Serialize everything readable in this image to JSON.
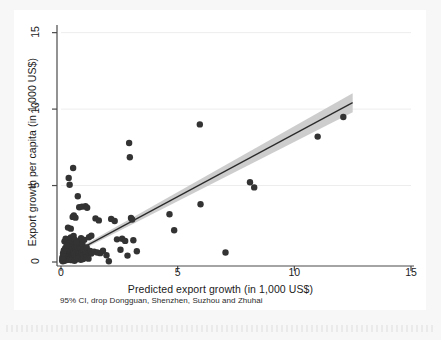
{
  "figure": {
    "background": "#f7f7f7",
    "panel_background": "#ffffff",
    "note": "95% CI, drop Dongguan, Shenzhen, Suzhou and Zhuhai"
  },
  "chart_data": {
    "type": "scatter",
    "title": "",
    "xlabel": "Predicted export growth (in 1,000 US$)",
    "ylabel": "Export growth per capita (in 1,000 US$)",
    "xlim": [
      0,
      15
    ],
    "ylim": [
      0,
      15.5
    ],
    "xticks": [
      0,
      5,
      10,
      15
    ],
    "yticks": [
      0,
      5,
      10,
      15
    ],
    "xtick_labels": [
      "0",
      "5",
      "10",
      "15"
    ],
    "ytick_labels": [
      "0",
      "5",
      "10",
      "15"
    ],
    "grid": "horizontal-faint",
    "legend": "none",
    "marker_color": "#333333",
    "marker_size": 3.2,
    "line_color": "#2a2a2a",
    "band_color": "#c4c4c4",
    "band_opacity": 0.85,
    "fit": {
      "label": "linear fit with 95% CI",
      "x_start": 0.3,
      "y_start": 0.42,
      "x_end": 12.5,
      "y_end": 10.42,
      "slope": 0.82,
      "intercept": 0.17,
      "ci_halfwidth_start": 0.1,
      "ci_halfwidth_end": 0.62
    },
    "points": [
      [
        0.05,
        0.1
      ],
      [
        0.07,
        0.22
      ],
      [
        0.08,
        0.05
      ],
      [
        0.09,
        0.35
      ],
      [
        0.1,
        0.15
      ],
      [
        0.11,
        0.48
      ],
      [
        0.12,
        0.28
      ],
      [
        0.13,
        0.62
      ],
      [
        0.14,
        0.08
      ],
      [
        0.15,
        0.4
      ],
      [
        0.16,
        0.2
      ],
      [
        0.17,
        0.7
      ],
      [
        0.18,
        0.33
      ],
      [
        0.19,
        0.55
      ],
      [
        0.2,
        0.12
      ],
      [
        0.21,
        0.85
      ],
      [
        0.22,
        0.45
      ],
      [
        0.23,
        0.25
      ],
      [
        0.24,
        0.6
      ],
      [
        0.25,
        0.18
      ],
      [
        0.26,
        0.95
      ],
      [
        0.27,
        0.38
      ],
      [
        0.28,
        0.72
      ],
      [
        0.29,
        0.3
      ],
      [
        0.3,
        0.52
      ],
      [
        0.31,
        0.15
      ],
      [
        0.32,
        0.8
      ],
      [
        0.33,
        0.42
      ],
      [
        0.34,
        1.05
      ],
      [
        0.35,
        0.26
      ],
      [
        0.36,
        0.66
      ],
      [
        0.37,
        0.36
      ],
      [
        0.38,
        0.9
      ],
      [
        0.39,
        0.2
      ],
      [
        0.4,
        0.58
      ],
      [
        0.41,
        0.44
      ],
      [
        0.42,
        1.15
      ],
      [
        0.43,
        0.32
      ],
      [
        0.44,
        0.76
      ],
      [
        0.45,
        0.24
      ],
      [
        0.46,
        0.5
      ],
      [
        0.47,
        1.0
      ],
      [
        0.48,
        0.68
      ],
      [
        0.49,
        0.4
      ],
      [
        0.5,
        0.86
      ],
      [
        0.51,
        0.3
      ],
      [
        0.52,
        0.6
      ],
      [
        0.53,
        1.25
      ],
      [
        0.54,
        0.46
      ],
      [
        0.55,
        0.74
      ],
      [
        0.56,
        0.22
      ],
      [
        0.57,
        0.96
      ],
      [
        0.58,
        0.54
      ],
      [
        0.59,
        1.4
      ],
      [
        0.6,
        0.35
      ],
      [
        0.62,
        0.82
      ],
      [
        0.64,
        0.64
      ],
      [
        0.66,
        1.1
      ],
      [
        0.68,
        0.48
      ],
      [
        0.7,
        0.92
      ],
      [
        0.72,
        0.28
      ],
      [
        0.74,
        1.3
      ],
      [
        0.76,
        0.7
      ],
      [
        0.78,
        0.56
      ],
      [
        0.8,
        1.02
      ],
      [
        0.82,
        0.4
      ],
      [
        0.84,
        0.88
      ],
      [
        0.86,
        1.55
      ],
      [
        0.88,
        0.62
      ],
      [
        0.9,
        0.34
      ],
      [
        0.92,
        1.18
      ],
      [
        0.95,
        0.78
      ],
      [
        0.98,
        0.5
      ],
      [
        1.0,
        1.45
      ],
      [
        1.05,
        0.68
      ],
      [
        1.1,
        0.95
      ],
      [
        1.15,
        0.42
      ],
      [
        1.2,
        1.62
      ],
      [
        1.25,
        0.72
      ],
      [
        1.3,
        0.56
      ],
      [
        0.15,
        1.35
      ],
      [
        0.2,
        1.52
      ],
      [
        0.26,
        1.28
      ],
      [
        0.31,
        1.48
      ],
      [
        0.36,
        1.22
      ],
      [
        0.42,
        1.6
      ],
      [
        0.48,
        1.36
      ],
      [
        0.54,
        1.7
      ],
      [
        0.6,
        1.44
      ],
      [
        0.66,
        1.3
      ],
      [
        0.3,
        2.25
      ],
      [
        0.42,
        2.18
      ],
      [
        0.5,
        2.95
      ],
      [
        0.55,
        3.05
      ],
      [
        0.62,
        2.9
      ],
      [
        0.33,
        5.5
      ],
      [
        0.37,
        5.05
      ],
      [
        0.52,
        6.15
      ],
      [
        0.72,
        4.3
      ],
      [
        0.78,
        3.58
      ],
      [
        0.9,
        3.62
      ],
      [
        1.05,
        3.65
      ],
      [
        1.12,
        3.55
      ],
      [
        1.48,
        2.85
      ],
      [
        1.62,
        2.72
      ],
      [
        1.3,
        1.72
      ],
      [
        1.42,
        0.68
      ],
      [
        1.55,
        0.62
      ],
      [
        1.68,
        0.58
      ],
      [
        1.8,
        0.74
      ],
      [
        1.95,
        0.44
      ],
      [
        2.05,
        0.05
      ],
      [
        2.15,
        2.82
      ],
      [
        2.3,
        2.68
      ],
      [
        2.4,
        1.48
      ],
      [
        2.55,
        0.8
      ],
      [
        2.62,
        1.52
      ],
      [
        2.75,
        1.38
      ],
      [
        2.85,
        0.42
      ],
      [
        2.92,
        7.78
      ],
      [
        2.95,
        6.85
      ],
      [
        3.0,
        2.88
      ],
      [
        3.05,
        2.78
      ],
      [
        3.1,
        1.42
      ],
      [
        3.25,
        0.7
      ],
      [
        4.65,
        3.12
      ],
      [
        4.85,
        2.08
      ],
      [
        5.95,
        9.0
      ],
      [
        5.98,
        3.78
      ],
      [
        7.05,
        0.62
      ],
      [
        8.1,
        5.22
      ],
      [
        8.28,
        4.88
      ],
      [
        11.0,
        8.2
      ],
      [
        12.1,
        9.48
      ],
      [
        0.06,
        0.3
      ],
      [
        0.09,
        0.58
      ],
      [
        0.12,
        0.75
      ],
      [
        0.18,
        0.9
      ],
      [
        0.24,
        1.08
      ],
      [
        0.45,
        0.12
      ],
      [
        0.58,
        0.08
      ],
      [
        0.68,
        0.18
      ],
      [
        0.75,
        0.25
      ],
      [
        0.85,
        0.15
      ],
      [
        0.95,
        0.2
      ],
      [
        1.08,
        0.3
      ],
      [
        1.18,
        0.22
      ]
    ]
  }
}
